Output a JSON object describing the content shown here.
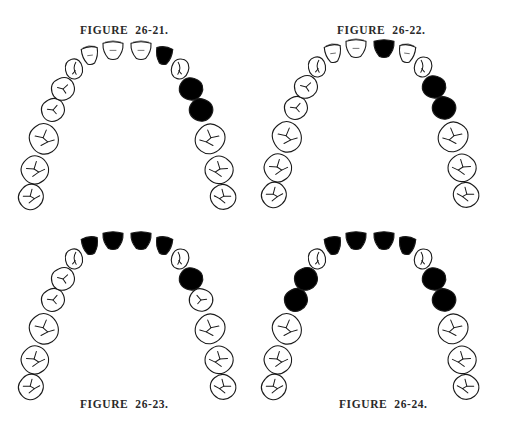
{
  "figures": [
    {
      "label": "FIGURE  26-21.",
      "caption_position": "top",
      "filled_teeth": {
        "left": [],
        "right": [
          1,
          3,
          4
        ]
      }
    },
    {
      "label": "FIGURE  26-22.",
      "caption_position": "top",
      "filled_teeth": {
        "left": [],
        "right": [
          0,
          3,
          4
        ]
      }
    },
    {
      "label": "FIGURE  26-23.",
      "caption_position": "bottom",
      "filled_teeth": {
        "left": [
          0,
          1
        ],
        "right": [
          0,
          1,
          3
        ]
      }
    },
    {
      "label": "FIGURE  26-24.",
      "caption_position": "bottom",
      "filled_teeth": {
        "left": [
          0,
          1,
          3,
          4
        ],
        "right": [
          0,
          1,
          3,
          4
        ]
      }
    }
  ],
  "tooth_order": [
    "central incisor",
    "lateral incisor",
    "canine",
    "first premolar",
    "second premolar",
    "first molar",
    "second molar",
    "third molar"
  ],
  "colors": {
    "outline": "#1a1a1a",
    "filled": "#000000",
    "unfilled": "#ffffff",
    "caption": "#2a2a2a"
  }
}
